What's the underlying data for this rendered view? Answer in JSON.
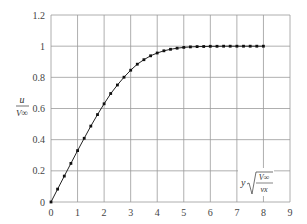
{
  "chart_data": {
    "type": "line",
    "title": "",
    "xlabel": "y√(V∞/νx)",
    "ylabel": "u/V∞",
    "xlabel_parts": {
      "var": "y",
      "num": "V∞",
      "den": "νx"
    },
    "ylabel_parts": {
      "num": "u",
      "den": "V∞"
    },
    "xlim": [
      0,
      9
    ],
    "ylim": [
      0,
      1.2
    ],
    "grid": true,
    "legend": null,
    "x_ticks": [
      "0",
      "1",
      "2",
      "3",
      "4",
      "5",
      "6",
      "7",
      "8",
      "9"
    ],
    "y_ticks": [
      "0",
      "0.2",
      "0.4",
      "0.6",
      "0.8",
      "1",
      "1.2"
    ],
    "series": [
      {
        "name": "Blasius velocity profile",
        "marker": "square-dot",
        "color": "#111111",
        "x": [
          0,
          0.25,
          0.5,
          0.75,
          1.0,
          1.25,
          1.5,
          1.75,
          2.0,
          2.25,
          2.5,
          2.75,
          3.0,
          3.25,
          3.5,
          3.75,
          4.0,
          4.25,
          4.5,
          4.75,
          5.0,
          5.25,
          5.5,
          5.75,
          6.0,
          6.25,
          6.5,
          6.75,
          7.0,
          7.25,
          7.5,
          7.75,
          8.0
        ],
        "values": [
          0,
          0.083,
          0.166,
          0.248,
          0.33,
          0.409,
          0.487,
          0.561,
          0.63,
          0.696,
          0.751,
          0.801,
          0.846,
          0.884,
          0.913,
          0.938,
          0.956,
          0.97,
          0.98,
          0.987,
          0.992,
          0.995,
          0.997,
          0.998,
          0.999,
          0.999,
          1.0,
          1.0,
          1.0,
          1.0,
          1.0,
          1.0,
          1.0
        ]
      }
    ]
  }
}
